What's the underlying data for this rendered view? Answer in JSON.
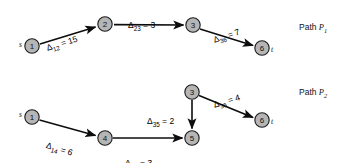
{
  "figure": {
    "type": "network-path-diagram",
    "background_color": "#ffffff",
    "node_fill_color": "#b5b5b5",
    "node_stroke_color": "#1a1a1a",
    "edge_color": "#0d0d0d"
  },
  "paths": [
    {
      "caption_prefix": "Path ",
      "caption_symbol": "P",
      "caption_subscript": "1",
      "source_label": "s",
      "sink_label": "t",
      "nodes": [
        {
          "id": "p1-n1",
          "label": "1",
          "x": 32,
          "y": 46
        },
        {
          "id": "p1-n2",
          "label": "2",
          "x": 105,
          "y": 24
        },
        {
          "id": "p1-n3",
          "label": "3",
          "x": 193,
          "y": 25
        },
        {
          "id": "p1-n6",
          "label": "6",
          "x": 262,
          "y": 48
        }
      ],
      "edges": [
        {
          "from": "1",
          "to": "2",
          "symbol": "Δ",
          "subscript": "12",
          "relation": "=",
          "value": "15",
          "label_x": 46,
          "label_y": 37,
          "rotation": -17
        },
        {
          "from": "2",
          "to": "3",
          "symbol": "Δ",
          "subscript": "23",
          "relation": "=",
          "value": "3",
          "label_x": 128,
          "label_y": 14,
          "rotation": 0
        },
        {
          "from": "3",
          "to": "6",
          "symbol": "Δ",
          "subscript": "36",
          "relation": "=",
          "value": "7",
          "label_x": 213,
          "label_y": 29,
          "rotation": -18
        }
      ]
    },
    {
      "caption_prefix": "Path ",
      "caption_symbol": "P",
      "caption_subscript": "2",
      "source_label": "s",
      "sink_label": "t",
      "nodes": [
        {
          "id": "p2-n1",
          "label": "1",
          "x": 32,
          "y": 117
        },
        {
          "id": "p2-n4",
          "label": "4",
          "x": 105,
          "y": 138
        },
        {
          "id": "p2-n5",
          "label": "5",
          "x": 192,
          "y": 138
        },
        {
          "id": "p2-n3",
          "label": "3",
          "x": 192,
          "y": 92
        },
        {
          "id": "p2-n6",
          "label": "6",
          "x": 262,
          "y": 120
        }
      ],
      "edges": [
        {
          "from": "1",
          "to": "4",
          "symbol": "Δ",
          "subscript": "14",
          "relation": "=",
          "value": "6",
          "label_x": 47,
          "label_y": 134,
          "rotation": 17
        },
        {
          "from": "4",
          "to": "5",
          "symbol": "Δ",
          "subscript": "45",
          "relation": "=",
          "value": "3",
          "label_x": 125,
          "label_y": 152,
          "rotation": 0
        },
        {
          "from": "3",
          "to": "5",
          "symbol": "Δ",
          "subscript": "35",
          "relation": "=",
          "value": "2",
          "label_x": 147,
          "label_y": 110,
          "rotation": 0
        },
        {
          "from": "3",
          "to": "6",
          "symbol": "Δ",
          "subscript": "36",
          "relation": "=",
          "value": "4",
          "label_x": 213,
          "label_y": 94,
          "rotation": -17
        }
      ]
    }
  ],
  "captions": [
    {
      "x": 299,
      "y": 27,
      "prefix": "Path ",
      "symbol": "P",
      "subscript": "1"
    },
    {
      "x": 299,
      "y": 92,
      "prefix": "Path ",
      "symbol": "P",
      "subscript": "2"
    }
  ],
  "terminals": [
    {
      "name": "p1-source",
      "label": "s",
      "x": 19,
      "y": 44
    },
    {
      "name": "p1-sink",
      "label": "t",
      "x": 271,
      "y": 49
    },
    {
      "name": "p2-source",
      "label": "s",
      "x": 19,
      "y": 114
    },
    {
      "name": "p2-sink",
      "label": "t",
      "x": 271,
      "y": 121
    }
  ]
}
